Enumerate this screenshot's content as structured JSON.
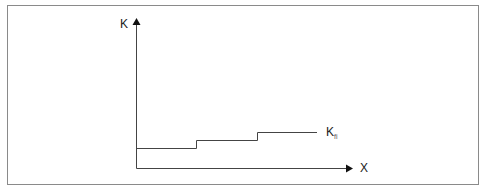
{
  "diagram": {
    "y_axis_label": "K",
    "x_axis_label": "X",
    "curve_label": {
      "main": "K",
      "subscript": "fi"
    },
    "type": "step-function",
    "steps": [
      {
        "x_start": 0,
        "x_end": 1,
        "level": 1
      },
      {
        "x_start": 1,
        "x_end": 2,
        "level": 2
      },
      {
        "x_start": 2,
        "x_end": 3,
        "level": 3
      }
    ]
  }
}
